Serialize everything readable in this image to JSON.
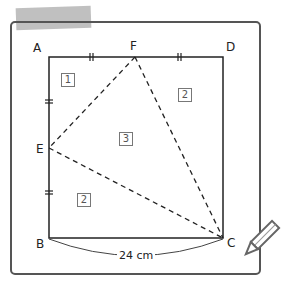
{
  "diagram": {
    "vertices": {
      "A": "A",
      "B": "B",
      "C": "C",
      "D": "D",
      "E": "E",
      "F": "F"
    },
    "regions": {
      "r1": "1",
      "r2_top": "2",
      "r3": "3",
      "r2_bottom": "2"
    },
    "measurement": "24 cm",
    "colors": {
      "line": "#222222",
      "frame": "#555555",
      "tape": "#aaaaaa",
      "box_border": "#777777"
    }
  }
}
